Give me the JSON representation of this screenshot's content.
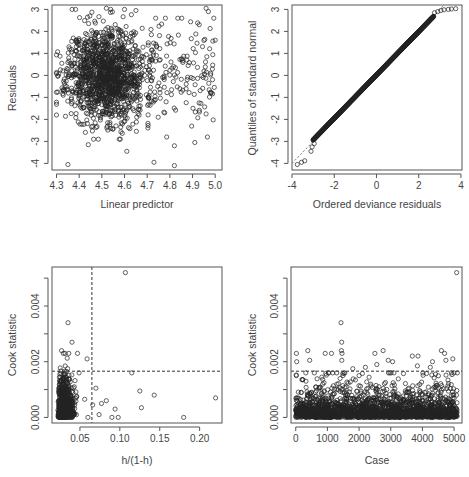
{
  "figure": {
    "width": 469,
    "height": 477,
    "point_color": "#222222",
    "line_color": "#333333"
  },
  "chart_data": [
    {
      "id": "residuals-vs-linear-predictor",
      "type": "scatter",
      "title": "",
      "xlabel": "Linear predictor",
      "ylabel": "Residuals",
      "xlim": [
        4.28,
        5.03
      ],
      "ylim": [
        -4.3,
        3.2
      ],
      "xticks": [
        4.3,
        4.4,
        4.5,
        4.6,
        4.7,
        4.8,
        4.9,
        5.0
      ],
      "xtick_labels": [
        "4.3",
        "4.4",
        "4.5",
        "4.6",
        "4.7",
        "4.8",
        "4.9",
        "5.0"
      ],
      "yticks": [
        -4,
        -3,
        -2,
        -1,
        0,
        1,
        2,
        3
      ],
      "ytick_labels": [
        "-4",
        "-3",
        "-2",
        "-1",
        "0",
        "1",
        "2",
        "3"
      ],
      "grid": false,
      "box": {
        "x": 52,
        "y": 5,
        "w": 170,
        "h": 165
      },
      "cloud": {
        "n": 1400,
        "x_mean": 4.52,
        "x_sd": 0.085,
        "y_mean": 0.0,
        "y_sd": 1.05,
        "seed": 11
      },
      "sparse_cloud": {
        "n": 140,
        "x_min": 4.7,
        "x_max": 5.0,
        "y_mean": 0.2,
        "y_sd": 1.2,
        "seed": 29
      },
      "notable_points": [
        {
          "x": 4.35,
          "y": -4.05
        },
        {
          "x": 4.73,
          "y": -3.95
        },
        {
          "x": 4.82,
          "y": -4.1
        },
        {
          "x": 4.61,
          "y": -3.45
        },
        {
          "x": 4.91,
          "y": -3.05
        },
        {
          "x": 4.82,
          "y": -3.2
        },
        {
          "x": 4.96,
          "y": 3.05
        },
        {
          "x": 4.97,
          "y": 2.9
        },
        {
          "x": 4.52,
          "y": 3.05
        },
        {
          "x": 4.6,
          "y": 3.0
        },
        {
          "x": 4.65,
          "y": 2.95
        },
        {
          "x": 4.44,
          "y": -3.15
        },
        {
          "x": 4.98,
          "y": -0.8
        },
        {
          "x": 4.96,
          "y": -1.75
        },
        {
          "x": 5.0,
          "y": 1.6
        }
      ]
    },
    {
      "id": "normal-qq",
      "type": "scatter",
      "title": "",
      "xlabel": "Ordered deviance residuals",
      "ylabel": "Quantiles of standard normal",
      "xlim": [
        -4.0,
        4.05
      ],
      "ylim": [
        -4.3,
        3.2
      ],
      "xticks": [
        -4,
        -2,
        0,
        2,
        4
      ],
      "xtick_labels": [
        "-4",
        "-2",
        "0",
        "2",
        "4"
      ],
      "yticks": [
        -4,
        -3,
        -2,
        -1,
        0,
        1,
        2,
        3
      ],
      "ytick_labels": [
        "-4",
        "-3",
        "-2",
        "-1",
        "0",
        "1",
        "2",
        "3"
      ],
      "grid": false,
      "box": {
        "x": 292,
        "y": 5,
        "w": 170,
        "h": 165
      },
      "reference_line": {
        "from": [
          -4.0,
          -4.0
        ],
        "to": [
          3.3,
          3.3
        ],
        "style": "dashed"
      },
      "qq_curve": {
        "n": 900,
        "x_from": -3.0,
        "x_to": 2.7
      },
      "notable_points": [
        {
          "x": -3.75,
          "y": -4.05
        },
        {
          "x": -3.55,
          "y": -3.95
        },
        {
          "x": -3.4,
          "y": -3.88
        },
        {
          "x": -3.1,
          "y": -3.45
        },
        {
          "x": -3.05,
          "y": -3.25
        },
        {
          "x": -2.95,
          "y": -3.1
        },
        {
          "x": 2.75,
          "y": 2.85
        },
        {
          "x": 2.9,
          "y": 2.9
        },
        {
          "x": 3.05,
          "y": 2.95
        },
        {
          "x": 3.2,
          "y": 2.98
        },
        {
          "x": 3.4,
          "y": 3.0
        },
        {
          "x": 3.55,
          "y": 3.02
        },
        {
          "x": 3.75,
          "y": 3.03
        }
      ]
    },
    {
      "id": "cook-vs-leverage",
      "type": "scatter",
      "title": "",
      "xlabel": "h/(1-h)",
      "ylabel": "Cook statistic",
      "xlim": [
        0.015,
        0.228
      ],
      "ylim": [
        -0.0002,
        0.0054
      ],
      "xticks": [
        0.05,
        0.1,
        0.15,
        0.2
      ],
      "xtick_labels": [
        "0.05",
        "0.10",
        "0.15",
        "0.20"
      ],
      "yticks": [
        0.0,
        0.001,
        0.002,
        0.003,
        0.004,
        0.005
      ],
      "ytick_labels": [
        "0.000",
        "",
        "0.002",
        "",
        "0.004",
        ""
      ],
      "grid": false,
      "box": {
        "x": 52,
        "y": 267,
        "w": 170,
        "h": 156
      },
      "vline": 0.065,
      "hline": 0.00166,
      "cloud": {
        "n": 1100,
        "x_min": 0.022,
        "x_sd": 0.006,
        "y_scale": 0.00035,
        "seed": 7
      },
      "notable_points": [
        {
          "x": 0.107,
          "y": 0.0052
        },
        {
          "x": 0.035,
          "y": 0.0034
        },
        {
          "x": 0.04,
          "y": 0.0027
        },
        {
          "x": 0.059,
          "y": 0.0021
        },
        {
          "x": 0.115,
          "y": 0.0016
        },
        {
          "x": 0.07,
          "y": 0.00105
        },
        {
          "x": 0.125,
          "y": 0.00095
        },
        {
          "x": 0.143,
          "y": 0.0008
        },
        {
          "x": 0.22,
          "y": 0.0007
        },
        {
          "x": 0.083,
          "y": 0.0006
        },
        {
          "x": 0.077,
          "y": 0.0005
        },
        {
          "x": 0.066,
          "y": 0.00045
        },
        {
          "x": 0.094,
          "y": 0.0003
        },
        {
          "x": 0.127,
          "y": 0.00035
        },
        {
          "x": 0.074,
          "y": 0.0001
        },
        {
          "x": 0.09,
          "y": 0.0
        },
        {
          "x": 0.098,
          "y": 0.0
        },
        {
          "x": 0.18,
          "y": 0.0
        },
        {
          "x": 0.06,
          "y": 0.0
        },
        {
          "x": 0.027,
          "y": 0.0024
        },
        {
          "x": 0.036,
          "y": 0.0023
        },
        {
          "x": 0.047,
          "y": 0.0023
        },
        {
          "x": 0.049,
          "y": 0.0016
        },
        {
          "x": 0.056,
          "y": 0.00065
        }
      ]
    },
    {
      "id": "cook-vs-case",
      "type": "scatter",
      "title": "",
      "xlabel": "Case",
      "ylabel": "Cook statistic",
      "xlim": [
        -150,
        5250
      ],
      "ylim": [
        -0.0002,
        0.0054
      ],
      "xticks": [
        0,
        1000,
        2000,
        3000,
        4000,
        5000
      ],
      "xtick_labels": [
        "0",
        "1000",
        "2000",
        "3000",
        "4000",
        "5000"
      ],
      "yticks": [
        0.0,
        0.001,
        0.002,
        0.003,
        0.004,
        0.005
      ],
      "ytick_labels": [
        "0.000",
        "",
        "0.002",
        "",
        "0.004",
        ""
      ],
      "grid": false,
      "box": {
        "x": 291,
        "y": 267,
        "w": 171,
        "h": 156
      },
      "hline": 0.00166,
      "cloud": {
        "n": 2200,
        "x_min": 0,
        "x_max": 5100,
        "y_scale": 0.00033,
        "seed": 3
      },
      "notable_points": [
        {
          "x": 5080,
          "y": 0.0052
        },
        {
          "x": 1430,
          "y": 0.0034
        },
        {
          "x": 1450,
          "y": 0.0027
        },
        {
          "x": 1440,
          "y": 0.0024
        },
        {
          "x": 1460,
          "y": 0.0023
        },
        {
          "x": 1455,
          "y": 0.00205
        },
        {
          "x": 20,
          "y": 0.0023
        },
        {
          "x": 30,
          "y": 0.002
        },
        {
          "x": 380,
          "y": 0.0024
        },
        {
          "x": 440,
          "y": 0.00205
        },
        {
          "x": 930,
          "y": 0.0023
        },
        {
          "x": 1130,
          "y": 0.0023
        },
        {
          "x": 2500,
          "y": 0.0023
        },
        {
          "x": 2760,
          "y": 0.0024
        },
        {
          "x": 2920,
          "y": 0.00205
        },
        {
          "x": 3060,
          "y": 0.002
        },
        {
          "x": 3680,
          "y": 0.0022
        },
        {
          "x": 3860,
          "y": 0.0022
        },
        {
          "x": 3840,
          "y": 0.00185
        },
        {
          "x": 4600,
          "y": 0.0024
        },
        {
          "x": 4700,
          "y": 0.0023
        },
        {
          "x": 4740,
          "y": 0.00205
        },
        {
          "x": 4960,
          "y": 0.0021
        },
        {
          "x": 4320,
          "y": 0.002
        },
        {
          "x": 4250,
          "y": 0.0018
        },
        {
          "x": 2200,
          "y": 0.0018
        },
        {
          "x": 1800,
          "y": 0.00175
        },
        {
          "x": 5100,
          "y": 0.0016
        },
        {
          "x": 2560,
          "y": 0.0019
        },
        {
          "x": 20,
          "y": 0.0015
        },
        {
          "x": 2000,
          "y": 0.0015
        },
        {
          "x": 1030,
          "y": 0.0016
        },
        {
          "x": 1170,
          "y": 0.0016
        }
      ]
    }
  ]
}
